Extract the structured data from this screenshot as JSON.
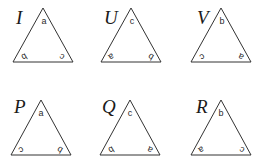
{
  "figure": {
    "triangles": [
      {
        "name": "I",
        "top": "a",
        "bottom_left": "b",
        "bottom_right": "c"
      },
      {
        "name": "U",
        "top": "c",
        "bottom_left": "a",
        "bottom_right": "b"
      },
      {
        "name": "V",
        "top": "b",
        "bottom_left": "c",
        "bottom_right": "a"
      },
      {
        "name": "P",
        "top": "a",
        "bottom_left": "c",
        "bottom_right": "b"
      },
      {
        "name": "Q",
        "top": "c",
        "bottom_left": "b",
        "bottom_right": "a"
      },
      {
        "name": "R",
        "top": "b",
        "bottom_left": "a",
        "bottom_right": "c"
      }
    ],
    "colors": {
      "line": "#333333",
      "text": "#1a1a1a"
    }
  }
}
